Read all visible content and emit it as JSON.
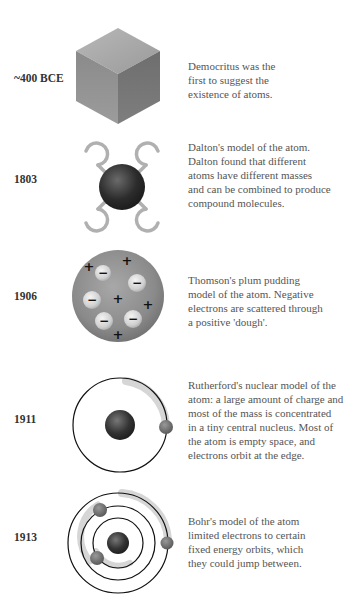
{
  "timeline": [
    {
      "year": "~400 BCE",
      "model": "Democritus",
      "icon": "cube-icon",
      "description": "Democritus was the\nfirst to suggest the\nexistence of atoms."
    },
    {
      "year": "1803",
      "model": "Dalton",
      "icon": "dalton-atom-icon",
      "description": "Dalton's model of the atom.\nDalton found that different\natoms have different masses\nand can be combined to produce\ncompound molecules."
    },
    {
      "year": "1906",
      "model": "Thomson",
      "icon": "plum-pudding-icon",
      "description": "Thomson's plum pudding\nmodel of the atom. Negative\nelectrons are scattered through\na positive 'dough'."
    },
    {
      "year": "1911",
      "model": "Rutherford",
      "icon": "rutherford-atom-icon",
      "description": "Rutherford's nuclear model of the\natom: a large amount of charge and\nmost of the mass is concentrated\nin a tiny central nucleus. Most of\nthe atom is empty space, and\nelectrons orbit at the edge."
    },
    {
      "year": "1913",
      "model": "Bohr",
      "icon": "bohr-atom-icon",
      "description": "Bohr's model of the atom\nlimited electrons to certain\nfixed energy orbits, which\nthey could jump between."
    }
  ],
  "thomson_charges": {
    "positive": "+",
    "negative": "−"
  }
}
